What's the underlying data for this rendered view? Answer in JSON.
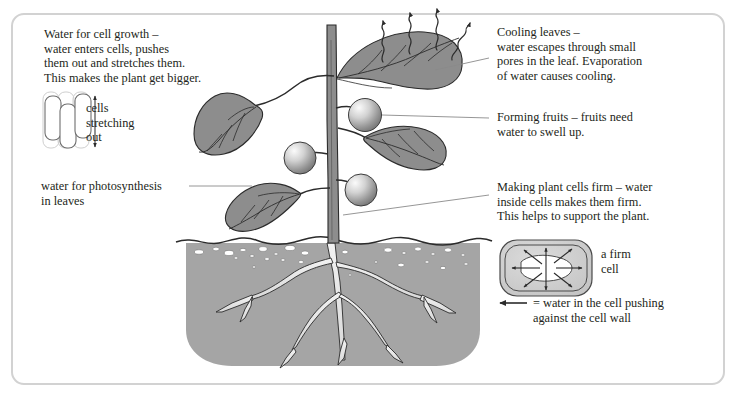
{
  "figure": {
    "background": "#ffffff",
    "frame_border_color": "#d2d2d2"
  },
  "colors": {
    "text": "#231f20",
    "leaf_fill": "#8d8d8d",
    "leaf_stroke": "#3a3a3a",
    "stem_fill": "#8d8d8d",
    "soil_fill": "#a5a5a5",
    "soil_stroke": "#2b2b2b",
    "root_fill": "#e3e3e3",
    "fruit_light": "#f2f2f2",
    "fruit_dark": "#7d7d7d",
    "cell_fill": "#cfcfcf",
    "leader_line": "#8a8a8a"
  },
  "annotations": {
    "cell_growth": {
      "name": "water-for-cell-growth",
      "lines": [
        "Water for cell growth –",
        "water enters cells, pushes",
        "them out and stretches them.",
        "This makes the plant get bigger."
      ]
    },
    "cells_stretching": {
      "name": "cells-stretching-out",
      "lines": [
        "cells",
        "stretching",
        "out"
      ]
    },
    "photosynthesis": {
      "name": "water-for-photosynthesis",
      "lines": [
        "water for photosynthesis",
        "in leaves"
      ]
    },
    "cooling": {
      "name": "cooling-leaves",
      "lines": [
        "Cooling leaves –",
        "water escapes through small",
        "pores in the leaf. Evaporation",
        "of water causes cooling."
      ]
    },
    "fruits": {
      "name": "forming-fruits",
      "lines": [
        "Forming fruits – fruits need",
        "water to swell up."
      ]
    },
    "firm_cells": {
      "name": "making-plant-cells-firm",
      "lines": [
        "Making plant cells firm – water",
        "inside cells makes them firm.",
        "This helps to support the plant."
      ]
    },
    "firm_cell_label": {
      "name": "a-firm-cell",
      "lines": [
        "a firm",
        "cell"
      ]
    },
    "legend": {
      "name": "legend-water-pushing",
      "arrow_glyph": "←",
      "lines": [
        "= water in the cell pushing",
        "against the cell wall"
      ]
    }
  },
  "diagram": {
    "plant": {
      "stem_label": "stem",
      "leaf_count": 4,
      "fruit_count": 3,
      "evaporation_arrow_count": 4,
      "root_branch_count": 5,
      "pebble_count": 28
    },
    "cell_stretch_diagram": {
      "cell_count": 3,
      "arrow": "double-headed-vertical"
    },
    "firm_cell_diagram": {
      "arrow_count": 8,
      "shape": "rounded-rectangle-double-wall"
    }
  }
}
